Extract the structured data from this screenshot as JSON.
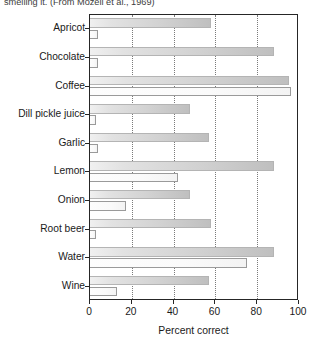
{
  "figure": {
    "caption": "smelling it. (From Mozell et al., 1969)"
  },
  "chart_data": {
    "type": "bar",
    "orientation": "horizontal",
    "title": "",
    "xlabel": "Percent correct",
    "ylabel": "",
    "xlim": [
      0,
      100
    ],
    "xticks": [
      0,
      20,
      40,
      60,
      80,
      100
    ],
    "xtick_labels": [
      "0",
      "20",
      "40",
      "60",
      "80",
      "100"
    ],
    "grid": "vertical-dotted",
    "legend": "none",
    "categories": [
      "Apricot",
      "Chocolate",
      "Coffee",
      "Dill pickle juice",
      "Garlic",
      "Lemon",
      "Onion",
      "Root beer",
      "Water",
      "Wine"
    ],
    "series": [
      {
        "name": "smelling",
        "fill": "gray",
        "values": [
          58,
          88,
          95,
          48,
          57,
          88,
          48,
          58,
          88,
          57
        ]
      },
      {
        "name": "tasting",
        "fill": "white",
        "values": [
          4,
          4,
          96,
          3,
          4,
          42,
          17,
          3,
          75,
          13
        ]
      }
    ]
  },
  "colors": {
    "axis": "#262626",
    "bar_smell": "#cfcfcf",
    "bar_taste": "#fdfdfd",
    "gridline": "#7a7a7a",
    "text": "#1a1a1a"
  }
}
